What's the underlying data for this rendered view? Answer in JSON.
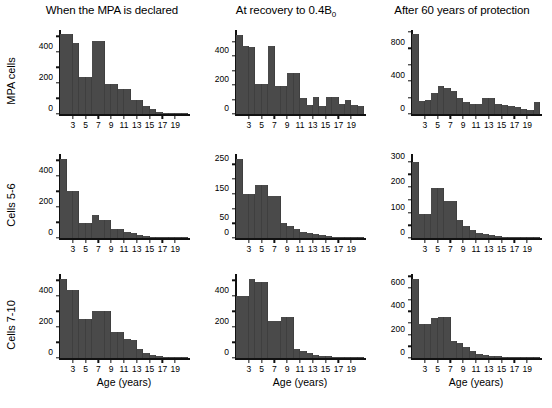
{
  "figure": {
    "bar_color": "#4a4a4a",
    "axis_color": "#111111",
    "background": "#ffffff"
  },
  "columns": [
    {
      "title": "When the MPA is declared",
      "title_sub": ""
    },
    {
      "title": "At recovery to 0.4B",
      "title_sub": "0"
    },
    {
      "title": "After 60 years of protection",
      "title_sub": ""
    }
  ],
  "rows": [
    {
      "label": "MPA cells"
    },
    {
      "label": "Cells 5-6"
    },
    {
      "label": "Cells 7-10"
    }
  ],
  "axis": {
    "xlabel": "Age (years)",
    "xticks": [
      3,
      5,
      7,
      9,
      11,
      13,
      15,
      17,
      19
    ]
  },
  "chart_data": [
    {
      "id": "mpa-cells-when-declared",
      "type": "bar",
      "title": "When the MPA is declared",
      "row": "MPA cells",
      "xlabel": "Age (years)",
      "ylabel": "MPA cells",
      "grid": false,
      "legend": "none",
      "xlim": [
        1,
        21
      ],
      "ylim": [
        0,
        540
      ],
      "yticks": [
        0,
        200,
        400
      ],
      "yticks_minor": [
        100,
        300,
        500
      ],
      "x": [
        1,
        2,
        3,
        4,
        5,
        6,
        7,
        8,
        9,
        10,
        11,
        12,
        13,
        14,
        15,
        16,
        17,
        18,
        19,
        20
      ],
      "values": [
        512,
        512,
        455,
        240,
        240,
        468,
        468,
        196,
        196,
        160,
        160,
        90,
        90,
        52,
        30,
        12,
        5,
        3,
        2,
        1
      ]
    },
    {
      "id": "mpa-cells-at-recovery",
      "type": "bar",
      "title": "At recovery to 0.4B0",
      "row": "MPA cells",
      "xlabel": "Age (years)",
      "ylabel": "MPA cells",
      "grid": false,
      "legend": "none",
      "xlim": [
        1,
        21
      ],
      "ylim": [
        0,
        580
      ],
      "yticks": [
        0,
        200,
        400
      ],
      "yticks_minor": [
        100,
        300,
        500
      ],
      "x": [
        1,
        2,
        3,
        4,
        5,
        6,
        7,
        8,
        9,
        10,
        11,
        12,
        13,
        14,
        15,
        16,
        17,
        18,
        19,
        20
      ],
      "values": [
        548,
        470,
        462,
        208,
        208,
        468,
        190,
        190,
        280,
        280,
        110,
        60,
        118,
        55,
        118,
        118,
        72,
        100,
        60,
        55
      ]
    },
    {
      "id": "mpa-cells-after-60-years",
      "type": "bar",
      "title": "After 60 years of protection",
      "row": "MPA cells",
      "xlabel": "Age (years)",
      "ylabel": "MPA cells",
      "grid": false,
      "legend": "none",
      "xlim": [
        1,
        21
      ],
      "ylim": [
        0,
        1020
      ],
      "yticks": [
        0,
        400,
        800
      ],
      "yticks_minor": [
        200,
        600,
        1000
      ],
      "x": [
        1,
        2,
        3,
        4,
        5,
        6,
        7,
        8,
        9,
        10,
        11,
        12,
        13,
        14,
        15,
        16,
        17,
        18,
        19,
        20
      ],
      "values": [
        975,
        160,
        170,
        250,
        340,
        315,
        285,
        195,
        150,
        120,
        120,
        200,
        200,
        120,
        110,
        95,
        85,
        60,
        45,
        150
      ]
    },
    {
      "id": "cells56-when-declared",
      "type": "bar",
      "title": "When the MPA is declared",
      "row": "Cells 5-6",
      "xlabel": "Age (years)",
      "ylabel": "Cells 5-6",
      "grid": false,
      "legend": "none",
      "xlim": [
        1,
        21
      ],
      "ylim": [
        0,
        540
      ],
      "yticks": [
        0,
        200,
        400
      ],
      "yticks_minor": [
        100,
        300,
        500
      ],
      "x": [
        1,
        2,
        3,
        4,
        5,
        6,
        7,
        8,
        9,
        10,
        11,
        12,
        13,
        14,
        15,
        16,
        17,
        18,
        19,
        20
      ],
      "values": [
        510,
        300,
        300,
        95,
        95,
        150,
        118,
        118,
        60,
        55,
        38,
        30,
        18,
        10,
        8,
        5,
        4,
        3,
        2,
        1
      ]
    },
    {
      "id": "cells56-at-recovery",
      "type": "bar",
      "title": "At recovery to 0.4B0",
      "row": "Cells 5-6",
      "xlabel": "Age (years)",
      "ylabel": "Cells 5-6",
      "grid": false,
      "legend": "none",
      "xlim": [
        1,
        21
      ],
      "ylim": [
        0,
        285
      ],
      "yticks": [
        0,
        50,
        150,
        250
      ],
      "yticks_minor": [
        100,
        200
      ],
      "x": [
        1,
        2,
        3,
        4,
        5,
        6,
        7,
        8,
        9,
        10,
        11,
        12,
        13,
        14,
        15,
        16,
        17,
        18,
        19,
        20
      ],
      "values": [
        268,
        148,
        148,
        180,
        180,
        142,
        142,
        50,
        40,
        30,
        22,
        16,
        12,
        9,
        7,
        5,
        4,
        3,
        2,
        1
      ]
    },
    {
      "id": "cells56-after-60-years",
      "type": "bar",
      "title": "After 60 years of protection",
      "row": "Cells 5-6",
      "xlabel": "Age (years)",
      "ylabel": "Cells 5-6",
      "grid": false,
      "legend": "none",
      "xlim": [
        1,
        21
      ],
      "ylim": [
        0,
        330
      ],
      "yticks": [
        0,
        100,
        200,
        300
      ],
      "yticks_minor": [
        50,
        150,
        250
      ],
      "x": [
        1,
        2,
        3,
        4,
        5,
        6,
        7,
        8,
        9,
        10,
        11,
        12,
        13,
        14,
        15,
        16,
        17,
        18,
        19,
        20
      ],
      "values": [
        300,
        95,
        95,
        195,
        195,
        145,
        145,
        72,
        48,
        30,
        20,
        14,
        10,
        7,
        5,
        4,
        3,
        2,
        2,
        1
      ]
    },
    {
      "id": "cells710-when-declared",
      "type": "bar",
      "title": "When the MPA is declared",
      "row": "Cells 7-10",
      "xlabel": "Age (years)",
      "ylabel": "Cells 7-10",
      "grid": false,
      "legend": "none",
      "xlim": [
        1,
        21
      ],
      "ylim": [
        0,
        540
      ],
      "yticks": [
        0,
        200,
        400
      ],
      "yticks_minor": [
        100,
        300,
        500
      ],
      "x": [
        1,
        2,
        3,
        4,
        5,
        6,
        7,
        8,
        9,
        10,
        11,
        12,
        13,
        14,
        15,
        16,
        17,
        18,
        19,
        20
      ],
      "values": [
        510,
        440,
        440,
        248,
        248,
        300,
        300,
        305,
        170,
        170,
        120,
        115,
        55,
        30,
        18,
        10,
        6,
        4,
        3,
        2
      ]
    },
    {
      "id": "cells710-at-recovery",
      "type": "bar",
      "title": "At recovery to 0.4B0",
      "row": "Cells 7-10",
      "xlabel": "Age (years)",
      "ylabel": "Cells 7-10",
      "grid": false,
      "legend": "none",
      "xlim": [
        1,
        21
      ],
      "ylim": [
        0,
        540
      ],
      "yticks": [
        0,
        200,
        400
      ],
      "yticks_minor": [
        100,
        300,
        500
      ],
      "x": [
        1,
        2,
        3,
        4,
        5,
        6,
        7,
        8,
        9,
        10,
        11,
        12,
        13,
        14,
        15,
        16,
        17,
        18,
        19,
        20
      ],
      "values": [
        400,
        400,
        510,
        490,
        490,
        238,
        238,
        265,
        265,
        60,
        42,
        30,
        22,
        16,
        12,
        9,
        6,
        5,
        3,
        2
      ]
    },
    {
      "id": "cells710-after-60-years",
      "type": "bar",
      "title": "After 60 years of protection",
      "row": "Cells 7-10",
      "xlabel": "Age (years)",
      "ylabel": "Cells 7-10",
      "grid": false,
      "legend": "none",
      "xlim": [
        1,
        21
      ],
      "ylim": [
        0,
        720
      ],
      "yticks": [
        0,
        200,
        400,
        600
      ],
      "yticks_minor": [
        100,
        300,
        500,
        700
      ],
      "x": [
        1,
        2,
        3,
        4,
        5,
        6,
        7,
        8,
        9,
        10,
        11,
        12,
        13,
        14,
        15,
        16,
        17,
        18,
        19,
        20
      ],
      "values": [
        675,
        290,
        290,
        340,
        350,
        350,
        150,
        130,
        95,
        60,
        38,
        25,
        18,
        13,
        9,
        7,
        5,
        4,
        3,
        2
      ]
    }
  ]
}
